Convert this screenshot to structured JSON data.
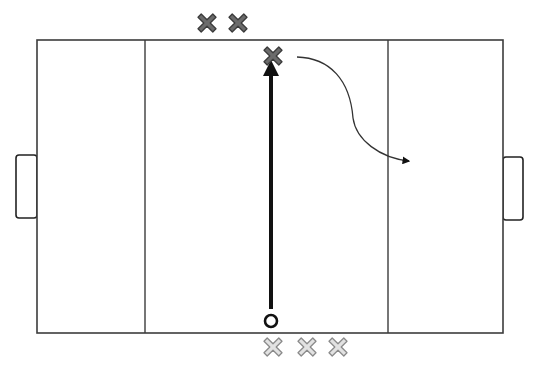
{
  "diagram": {
    "colors": {
      "background": "#ffffff",
      "line": "#3c3c3c",
      "pass_arrow": "#111111",
      "team_dark_fill": "#6b6b6b",
      "team_dark_stroke": "#3a3a3a",
      "team_light_fill": "#e2e2e2",
      "team_light_stroke": "#8a8a8a"
    },
    "field": {
      "x": 37,
      "y": 40,
      "width": 466,
      "height": 293
    },
    "zone_lines": [
      {
        "name": "left-zone-line",
        "x": 145
      },
      {
        "name": "right-zone-line",
        "x": 388
      }
    ],
    "goals": [
      {
        "name": "left-goal",
        "x": 16,
        "y": 155,
        "width": 21,
        "height": 63
      },
      {
        "name": "right-goal",
        "x": 503,
        "y": 157,
        "width": 20,
        "height": 63
      }
    ],
    "ball": {
      "cx": 271,
      "cy": 321,
      "r": 6
    },
    "pass": {
      "x1": 271,
      "y1": 309,
      "x2": 271,
      "y2": 68
    },
    "run_path": {
      "d": "M297 57 C 330 58, 350 80, 353 118 C 356 140, 380 158, 409 161"
    },
    "players_dark": [
      {
        "name": "dark-player-1",
        "cx": 207,
        "cy": 23
      },
      {
        "name": "dark-player-2",
        "cx": 238,
        "cy": 23
      },
      {
        "name": "dark-player-receiver",
        "cx": 273,
        "cy": 56
      }
    ],
    "players_light": [
      {
        "name": "light-player-1",
        "cx": 273,
        "cy": 347
      },
      {
        "name": "light-player-2",
        "cx": 307,
        "cy": 347
      },
      {
        "name": "light-player-3",
        "cx": 338,
        "cy": 347
      }
    ]
  }
}
